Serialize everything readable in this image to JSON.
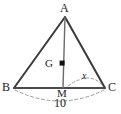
{
  "figure": {
    "type": "geometry-diagram",
    "background_color": "#ffffff",
    "stroke_color": "#3a3a3a",
    "dashed_color": "#9a9a9a",
    "point_color": "#111111"
  },
  "labels": {
    "apex": "A",
    "left_vertex": "B",
    "right_vertex": "C",
    "centroid": "G",
    "midpoint": "M",
    "base_length": "10",
    "angle": "x"
  },
  "geometry": {
    "points": {
      "A": {
        "x": 65,
        "y": 17
      },
      "B": {
        "x": 14,
        "y": 88
      },
      "C": {
        "x": 105,
        "y": 88
      },
      "M": {
        "x": 63,
        "y": 88
      },
      "G": {
        "x": 62,
        "y": 63
      }
    },
    "segments": [
      {
        "name": "side-AB",
        "from": "A",
        "to": "B"
      },
      {
        "name": "side-AC",
        "from": "A",
        "to": "C"
      },
      {
        "name": "base-BC",
        "from": "B",
        "to": "C"
      },
      {
        "name": "median-AM",
        "from": "A",
        "to": "M"
      }
    ],
    "dashed_arcs": [
      {
        "name": "base-measure-arc",
        "from": "B",
        "to": "C",
        "sag": 18
      },
      {
        "name": "angle-arc",
        "from": "M",
        "to": "C",
        "bulge": 12
      }
    ]
  }
}
